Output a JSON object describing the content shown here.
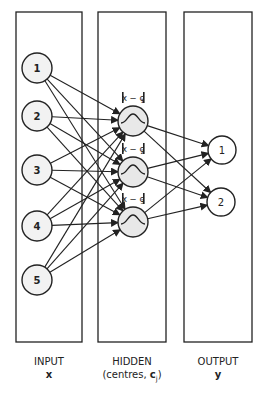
{
  "diagram": {
    "type": "rbf-network",
    "panels": [
      {
        "name": "input",
        "title": "INPUT",
        "symbol": "x",
        "x": 16,
        "y": 12,
        "w": 66,
        "h": 330
      },
      {
        "name": "hidden",
        "title": "HIDDEN",
        "subtitle": "(centres, ",
        "symbol": "c",
        "subscript": "j",
        "closing": ")",
        "x": 98,
        "y": 12,
        "w": 68,
        "h": 330
      },
      {
        "name": "output",
        "title": "OUTPUT",
        "symbol": "y",
        "x": 184,
        "y": 12,
        "w": 68,
        "h": 330
      }
    ],
    "input_nodes": [
      {
        "label": "1",
        "cx": 37,
        "cy": 68
      },
      {
        "label": "2",
        "cx": 37,
        "cy": 116
      },
      {
        "label": "3",
        "cx": 37,
        "cy": 170
      },
      {
        "label": "4",
        "cx": 37,
        "cy": 226
      },
      {
        "label": "5",
        "cx": 37,
        "cy": 280
      }
    ],
    "hidden_nodes": [
      {
        "label": "||x − c1||",
        "sub": "1",
        "cx": 133,
        "cy": 121
      },
      {
        "label": "||x − c2||",
        "sub": "2",
        "cx": 133,
        "cy": 172
      },
      {
        "label": "||x − c3||",
        "sub": "3",
        "cx": 133,
        "cy": 222
      }
    ],
    "output_nodes": [
      {
        "label": "1",
        "cx": 222,
        "cy": 150
      },
      {
        "label": "2",
        "cx": 221,
        "cy": 202
      }
    ],
    "node_radius": 15,
    "colors": {
      "stroke": "#222222",
      "node_fill": "#f2f2f2",
      "hidden_fill": "#e8e8e8",
      "background": "#ffffff"
    }
  },
  "labels": {
    "input_title": "INPUT",
    "input_symbol": "x",
    "hidden_title": "HIDDEN",
    "hidden_subtitle": "(centres, ",
    "hidden_symbol": "c",
    "hidden_subscript": "j",
    "hidden_close": ")",
    "output_title": "OUTPUT",
    "output_symbol": "y"
  }
}
